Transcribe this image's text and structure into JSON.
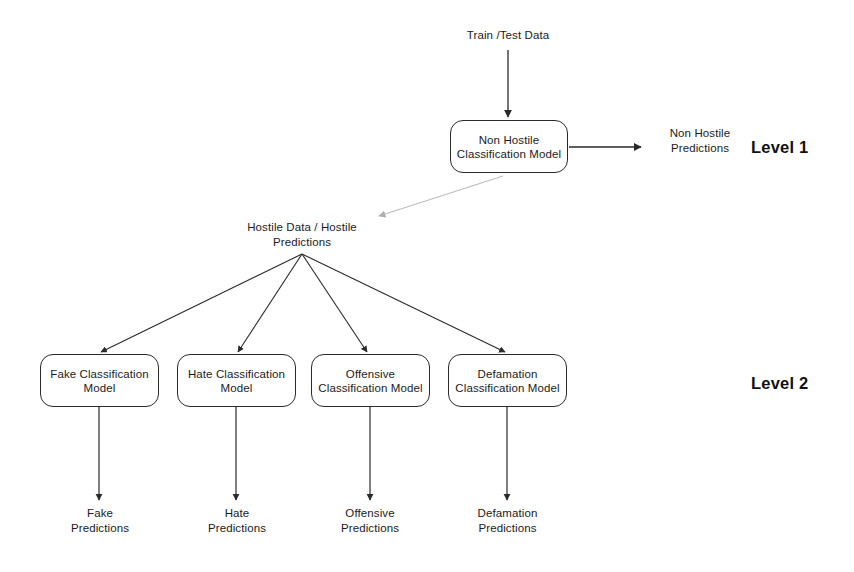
{
  "diagram": {
    "title_text_nodes": {
      "input": "Train /Test Data",
      "non_hostile_predictions": "Non Hostile\nPredictions",
      "hostile_data": "Hostile Data / Hostile\nPredictions",
      "fake_predictions": "Fake\nPredictions",
      "hate_predictions": "Hate\nPredictions",
      "offensive_predictions": "Offensive\nPredictions",
      "defamation_predictions": "Defamation\nPredictions"
    },
    "boxes": {
      "non_hostile_model": "Non Hostile\nClassification Model",
      "fake_model": "Fake Classification\nModel",
      "hate_model": "Hate Classification\nModel",
      "offensive_model": "Offensive\nClassification Model",
      "defamation_model": "Defamation\nClassification Model"
    },
    "levels": {
      "level_1": "Level 1",
      "level_2": "Level 2"
    },
    "colors": {
      "stroke": "#2a2a2a",
      "faded_stroke": "#b9b9b9",
      "text": "#1b1b1b",
      "background": "#ffffff"
    }
  }
}
